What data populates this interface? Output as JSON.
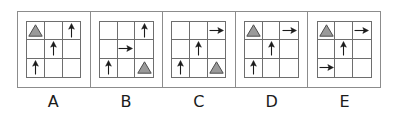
{
  "figure": {
    "kind": "multiple-choice-answer-options",
    "grid_rows": 3,
    "grid_cols": 3,
    "frame_border_color": "#8c8c8c",
    "grid_line_color": "#6e6e6e",
    "arrow_color": "#1b1b1b",
    "triangle_fill_color": "#9a9a9a",
    "triangle_stroke_color": "#4d4d4d",
    "background_color": "#ffffff"
  },
  "options": [
    {
      "label": "A",
      "cells": [
        [
          {
            "shape": "triangle",
            "name": "triangle-icon"
          },
          {
            "shape": "empty",
            "name": "empty-cell"
          },
          {
            "shape": "arrow-up",
            "name": "arrow-up-icon"
          }
        ],
        [
          {
            "shape": "empty",
            "name": "empty-cell"
          },
          {
            "shape": "arrow-up",
            "name": "arrow-up-icon"
          },
          {
            "shape": "empty",
            "name": "empty-cell"
          }
        ],
        [
          {
            "shape": "arrow-up",
            "name": "arrow-up-icon"
          },
          {
            "shape": "empty",
            "name": "empty-cell"
          },
          {
            "shape": "empty",
            "name": "empty-cell"
          }
        ]
      ]
    },
    {
      "label": "B",
      "cells": [
        [
          {
            "shape": "empty",
            "name": "empty-cell"
          },
          {
            "shape": "empty",
            "name": "empty-cell"
          },
          {
            "shape": "arrow-up",
            "name": "arrow-up-icon"
          }
        ],
        [
          {
            "shape": "empty",
            "name": "empty-cell"
          },
          {
            "shape": "arrow-right",
            "name": "arrow-right-icon"
          },
          {
            "shape": "empty",
            "name": "empty-cell"
          }
        ],
        [
          {
            "shape": "arrow-up",
            "name": "arrow-up-icon"
          },
          {
            "shape": "empty",
            "name": "empty-cell"
          },
          {
            "shape": "triangle",
            "name": "triangle-icon"
          }
        ]
      ]
    },
    {
      "label": "C",
      "cells": [
        [
          {
            "shape": "empty",
            "name": "empty-cell"
          },
          {
            "shape": "empty",
            "name": "empty-cell"
          },
          {
            "shape": "arrow-right",
            "name": "arrow-right-icon"
          }
        ],
        [
          {
            "shape": "empty",
            "name": "empty-cell"
          },
          {
            "shape": "arrow-up",
            "name": "arrow-up-icon"
          },
          {
            "shape": "empty",
            "name": "empty-cell"
          }
        ],
        [
          {
            "shape": "arrow-up",
            "name": "arrow-up-icon"
          },
          {
            "shape": "empty",
            "name": "empty-cell"
          },
          {
            "shape": "triangle",
            "name": "triangle-icon"
          }
        ]
      ]
    },
    {
      "label": "D",
      "cells": [
        [
          {
            "shape": "triangle",
            "name": "triangle-icon"
          },
          {
            "shape": "empty",
            "name": "empty-cell"
          },
          {
            "shape": "arrow-right",
            "name": "arrow-right-icon"
          }
        ],
        [
          {
            "shape": "empty",
            "name": "empty-cell"
          },
          {
            "shape": "arrow-up",
            "name": "arrow-up-icon"
          },
          {
            "shape": "empty",
            "name": "empty-cell"
          }
        ],
        [
          {
            "shape": "arrow-up",
            "name": "arrow-up-icon"
          },
          {
            "shape": "empty",
            "name": "empty-cell"
          },
          {
            "shape": "empty",
            "name": "empty-cell"
          }
        ]
      ]
    },
    {
      "label": "E",
      "cells": [
        [
          {
            "shape": "triangle",
            "name": "triangle-icon"
          },
          {
            "shape": "empty",
            "name": "empty-cell"
          },
          {
            "shape": "arrow-right",
            "name": "arrow-right-icon"
          }
        ],
        [
          {
            "shape": "empty",
            "name": "empty-cell"
          },
          {
            "shape": "arrow-up",
            "name": "arrow-up-icon"
          },
          {
            "shape": "empty",
            "name": "empty-cell"
          }
        ],
        [
          {
            "shape": "arrow-right",
            "name": "arrow-right-icon"
          },
          {
            "shape": "empty",
            "name": "empty-cell"
          },
          {
            "shape": "empty",
            "name": "empty-cell"
          }
        ]
      ]
    }
  ]
}
